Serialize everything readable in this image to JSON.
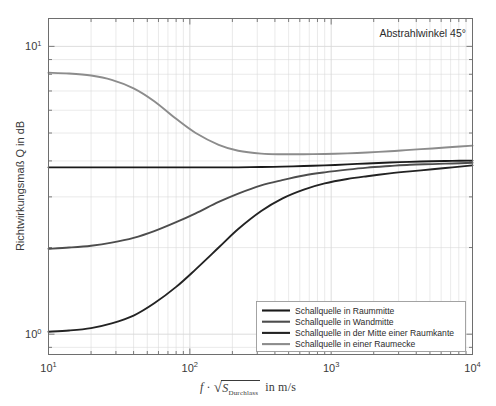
{
  "figure": {
    "annotation": "Abstrahlwinkel 45°",
    "background": "#ffffff",
    "frame_color": "#6e6e6e",
    "grid_color": "#d9d9d9"
  },
  "axes": {
    "x": {
      "label_parts": {
        "f": "f",
        "dot": "·",
        "sqrt": "√",
        "S": "S",
        "subscript": "Durchlass",
        "unit": "in m/s"
      },
      "label_plain": "f · √S_Durchlass in m/s",
      "scale": "log",
      "min": 10,
      "max": 10000,
      "ticks": [
        {
          "value": 10,
          "mantissa": "10",
          "exponent": "1"
        },
        {
          "value": 100,
          "mantissa": "10",
          "exponent": "2"
        },
        {
          "value": 1000,
          "mantissa": "10",
          "exponent": "3"
        },
        {
          "value": 10000,
          "mantissa": "10",
          "exponent": "4"
        }
      ]
    },
    "y": {
      "label": "Richtwirkungsmaß Q in dB",
      "scale": "log",
      "min": 0.85,
      "max": 12.5,
      "ticks": [
        {
          "value": 1,
          "mantissa": "10",
          "exponent": "0"
        },
        {
          "value": 10,
          "mantissa": "10",
          "exponent": "1"
        }
      ]
    }
  },
  "legend": {
    "position": "bottom-right-inside",
    "items": [
      {
        "label": "Schallquelle in Raummitte",
        "color": "#1a1a1a",
        "width": 2.1
      },
      {
        "label": "Schallquelle in Wandmitte",
        "color": "#4d4d4d",
        "width": 2.1
      },
      {
        "label": "Schallquelle in der Mitte einer Raumkante",
        "color": "#232323",
        "width": 2.1
      },
      {
        "label": "Schallquelle in einer Raumecke",
        "color": "#8c8c8c",
        "width": 2.1
      }
    ]
  },
  "chart_data": {
    "type": "line",
    "title": "",
    "subtitle": "",
    "annotation": "Abstrahlwinkel 45°",
    "xlabel": "f · √S_Durchlass in m/s",
    "ylabel": "Richtwirkungsmaß Q in dB",
    "xscale": "log",
    "yscale": "log",
    "xlim": [
      10,
      10000
    ],
    "ylim": [
      0.85,
      12.5
    ],
    "grid": true,
    "legend_position": "lower right",
    "x": [
      10,
      14,
      20,
      28,
      40,
      56,
      80,
      110,
      160,
      220,
      320,
      450,
      640,
      900,
      1300,
      1800,
      2600,
      3600,
      5200,
      7200,
      10000
    ],
    "series": [
      {
        "name": "Schallquelle in Raummitte",
        "color": "#1a1a1a",
        "values": [
          3.8,
          3.8,
          3.8,
          3.8,
          3.8,
          3.8,
          3.8,
          3.8,
          3.8,
          3.8,
          3.81,
          3.82,
          3.84,
          3.86,
          3.89,
          3.92,
          3.95,
          3.97,
          3.99,
          4.0,
          4.01
        ]
      },
      {
        "name": "Schallquelle in Wandmitte",
        "color": "#4d4d4d",
        "values": [
          1.98,
          2.0,
          2.03,
          2.08,
          2.16,
          2.28,
          2.45,
          2.63,
          2.88,
          3.08,
          3.29,
          3.43,
          3.56,
          3.65,
          3.73,
          3.79,
          3.84,
          3.88,
          3.9,
          3.92,
          3.94
        ]
      },
      {
        "name": "Schallquelle in der Mitte einer Raumkante",
        "color": "#232323",
        "values": [
          1.02,
          1.03,
          1.05,
          1.09,
          1.16,
          1.28,
          1.46,
          1.68,
          2.0,
          2.32,
          2.68,
          2.96,
          3.18,
          3.34,
          3.46,
          3.54,
          3.62,
          3.68,
          3.74,
          3.8,
          3.86
        ]
      },
      {
        "name": "Schallquelle in einer Raumecke",
        "color": "#8c8c8c",
        "values": [
          8.1,
          8.05,
          7.92,
          7.65,
          7.15,
          6.45,
          5.6,
          5.0,
          4.55,
          4.34,
          4.24,
          4.22,
          4.22,
          4.23,
          4.25,
          4.28,
          4.32,
          4.37,
          4.42,
          4.47,
          4.52
        ]
      }
    ]
  }
}
